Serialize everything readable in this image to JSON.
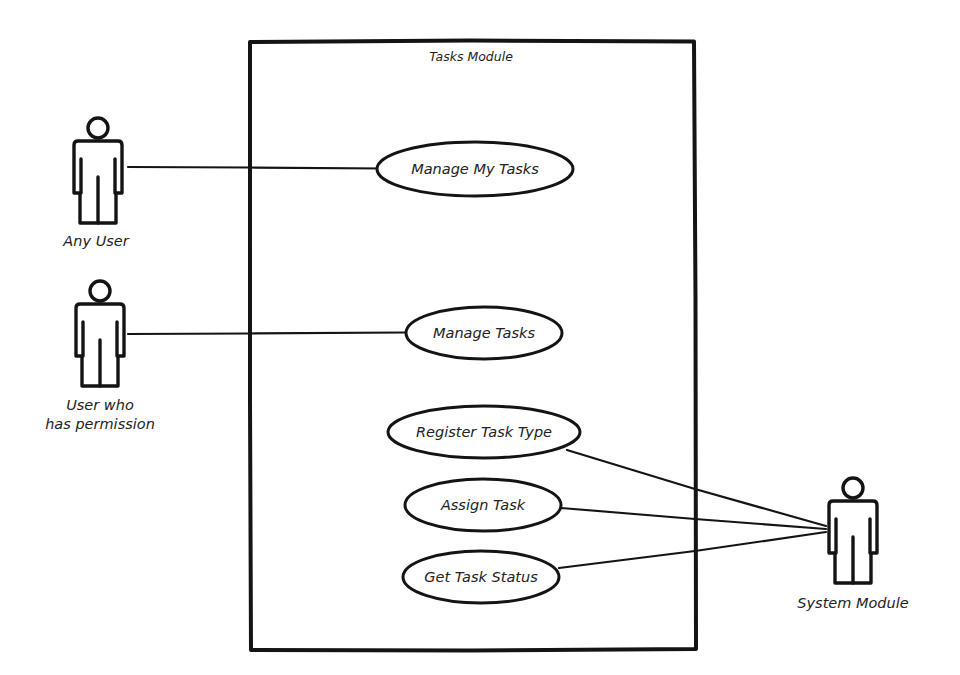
{
  "diagram": {
    "type": "uml-use-case",
    "system_boundary": {
      "title": "Tasks Module",
      "x": 249,
      "y": 41,
      "width": 446,
      "height": 609
    },
    "actors": [
      {
        "id": "any-user",
        "label_lines": [
          "Any User"
        ],
        "cx": 98,
        "top": 115
      },
      {
        "id": "user-with-permission",
        "label_lines": [
          "User who",
          "has permission"
        ],
        "cx": 100,
        "top": 278
      },
      {
        "id": "system-module",
        "label_lines": [
          "System Module"
        ],
        "cx": 853,
        "top": 475
      }
    ],
    "use_cases": [
      {
        "id": "manage-my-tasks",
        "label": "Manage My Tasks",
        "cx": 475,
        "cy": 169,
        "rx": 98,
        "ry": 27
      },
      {
        "id": "manage-tasks",
        "label": "Manage Tasks",
        "cx": 484,
        "cy": 333,
        "rx": 78,
        "ry": 26
      },
      {
        "id": "register-task-type",
        "label": "Register Task Type",
        "cx": 484,
        "cy": 432,
        "rx": 96,
        "ry": 26
      },
      {
        "id": "assign-task",
        "label": "Assign Task",
        "cx": 483,
        "cy": 505,
        "rx": 78,
        "ry": 26
      },
      {
        "id": "get-task-status",
        "label": "Get Task Status",
        "cx": 481,
        "cy": 577,
        "rx": 78,
        "ry": 26
      }
    ],
    "associations": [
      {
        "from": "any-user",
        "to": "manage-my-tasks"
      },
      {
        "from": "user-with-permission",
        "to": "manage-tasks"
      },
      {
        "from": "system-module",
        "to": "register-task-type"
      },
      {
        "from": "system-module",
        "to": "assign-task"
      },
      {
        "from": "system-module",
        "to": "get-task-status"
      }
    ],
    "colors": {
      "stroke": "#141414",
      "background": "#ffffff",
      "text": "#222222"
    }
  }
}
